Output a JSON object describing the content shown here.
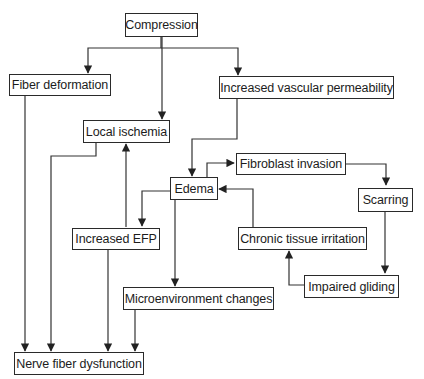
{
  "diagram": {
    "type": "flowchart",
    "nodes": {
      "compression": "Compression",
      "fiber_deformation": "Fiber deformation",
      "increased_vascular_permeability": "Increased vascular permeability",
      "local_ischemia": "Local ischemia",
      "fibroblast_invasion": "Fibroblast invasion",
      "edema": "Edema",
      "scarring": "Scarring",
      "increased_efp": "Increased EFP",
      "chronic_tissue_irritation": "Chronic tissue irritation",
      "impaired_gliding": "Impaired gliding",
      "microenvironment_changes": "Microenvironment changes",
      "nerve_fiber_dysfunction": "Nerve fiber dysfunction"
    },
    "edges": [
      {
        "from": "compression",
        "to": "fiber_deformation"
      },
      {
        "from": "compression",
        "to": "local_ischemia"
      },
      {
        "from": "compression",
        "to": "increased_vascular_permeability"
      },
      {
        "from": "increased_vascular_permeability",
        "to": "edema"
      },
      {
        "from": "edema",
        "to": "fibroblast_invasion"
      },
      {
        "from": "fibroblast_invasion",
        "to": "scarring"
      },
      {
        "from": "scarring",
        "to": "impaired_gliding"
      },
      {
        "from": "impaired_gliding",
        "to": "chronic_tissue_irritation"
      },
      {
        "from": "chronic_tissue_irritation",
        "to": "edema"
      },
      {
        "from": "edema",
        "to": "increased_efp"
      },
      {
        "from": "edema",
        "to": "microenvironment_changes"
      },
      {
        "from": "increased_efp",
        "to": "local_ischemia"
      },
      {
        "from": "fiber_deformation",
        "to": "nerve_fiber_dysfunction"
      },
      {
        "from": "local_ischemia",
        "to": "nerve_fiber_dysfunction"
      },
      {
        "from": "increased_efp",
        "to": "nerve_fiber_dysfunction"
      },
      {
        "from": "microenvironment_changes",
        "to": "nerve_fiber_dysfunction"
      }
    ],
    "colors": {
      "stroke": "#333333",
      "box_border": "#2a2a2a",
      "background": "#ffffff",
      "text": "#1c1c1c"
    }
  }
}
